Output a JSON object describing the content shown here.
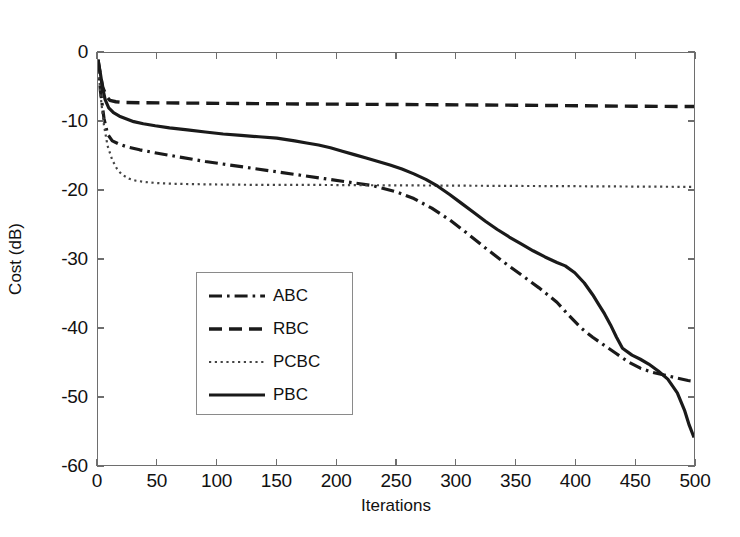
{
  "chart_data": {
    "type": "line",
    "title": "",
    "xlabel": "Iterations",
    "ylabel": "Cost (dB)",
    "xlim": [
      0,
      500
    ],
    "ylim": [
      -60,
      0
    ],
    "xticks": [
      0,
      50,
      100,
      150,
      200,
      250,
      300,
      350,
      400,
      450,
      500
    ],
    "yticks": [
      0,
      -10,
      -20,
      -30,
      -40,
      -50,
      -60
    ],
    "xticklabels": [
      "0",
      "50",
      "100",
      "150",
      "200",
      "250",
      "300",
      "350",
      "400",
      "450",
      "500"
    ],
    "yticklabels": [
      "0",
      "-10",
      "-20",
      "-30",
      "-40",
      "-50",
      "-60"
    ],
    "grid": false,
    "legend_position": "center-left",
    "series": [
      {
        "name": "ABC",
        "style": "dashdot",
        "color": "#1a1a1a",
        "x": [
          0,
          2,
          5,
          8,
          12,
          18,
          25,
          35,
          50,
          70,
          90,
          110,
          130,
          150,
          170,
          190,
          210,
          230,
          250,
          265,
          280,
          295,
          310,
          325,
          340,
          355,
          370,
          385,
          395,
          405,
          415,
          425,
          435,
          445,
          455,
          465,
          475,
          485,
          495,
          500
        ],
        "y": [
          -1.0,
          -5.5,
          -9.5,
          -11.8,
          -12.8,
          -13.3,
          -13.7,
          -14.1,
          -14.6,
          -15.2,
          -15.8,
          -16.3,
          -16.8,
          -17.3,
          -17.8,
          -18.3,
          -18.8,
          -19.3,
          -20.2,
          -21.2,
          -22.6,
          -24.3,
          -26.3,
          -28.4,
          -30.4,
          -32.3,
          -34.2,
          -36.3,
          -38.2,
          -40.0,
          -41.4,
          -42.6,
          -43.8,
          -45.0,
          -45.9,
          -46.5,
          -46.9,
          -47.3,
          -47.7,
          -47.8
        ]
      },
      {
        "name": "RBC",
        "style": "dashed",
        "color": "#1a1a1a",
        "x": [
          0,
          2,
          4,
          7,
          10,
          15,
          20,
          40,
          80,
          150,
          250,
          350,
          450,
          500
        ],
        "y": [
          -1.0,
          -3.2,
          -5.0,
          -6.3,
          -6.9,
          -7.1,
          -7.2,
          -7.25,
          -7.3,
          -7.4,
          -7.5,
          -7.6,
          -7.75,
          -7.8
        ]
      },
      {
        "name": "PCBC",
        "style": "dotted",
        "color": "#444444",
        "x": [
          0,
          2,
          5,
          8,
          12,
          16,
          20,
          26,
          32,
          40,
          50,
          65,
          80,
          100,
          130,
          170,
          220,
          280,
          340,
          400,
          450,
          500
        ],
        "y": [
          -1.0,
          -6.0,
          -10.5,
          -13.5,
          -15.6,
          -16.9,
          -17.7,
          -18.3,
          -18.6,
          -18.8,
          -18.95,
          -19.05,
          -19.1,
          -19.15,
          -19.2,
          -19.2,
          -19.25,
          -19.3,
          -19.35,
          -19.4,
          -19.45,
          -19.5
        ]
      },
      {
        "name": "PBC",
        "style": "solid",
        "color": "#1a1a1a",
        "x": [
          0,
          2,
          4,
          6,
          9,
          13,
          18,
          24,
          30,
          38,
          48,
          60,
          75,
          90,
          105,
          120,
          135,
          150,
          165,
          175,
          185,
          195,
          205,
          215,
          225,
          235,
          245,
          255,
          265,
          275,
          285,
          295,
          305,
          315,
          325,
          335,
          345,
          355,
          365,
          375,
          385,
          392,
          400,
          408,
          415,
          420,
          425,
          430,
          435,
          440,
          448,
          455,
          462,
          470,
          478,
          486,
          492,
          496,
          500
        ],
        "y": [
          -1.0,
          -3.0,
          -5.2,
          -6.8,
          -8.0,
          -8.7,
          -9.2,
          -9.6,
          -10.0,
          -10.3,
          -10.6,
          -10.9,
          -11.2,
          -11.5,
          -11.8,
          -12.0,
          -12.2,
          -12.4,
          -12.8,
          -13.1,
          -13.4,
          -13.8,
          -14.3,
          -14.8,
          -15.3,
          -15.8,
          -16.3,
          -16.9,
          -17.6,
          -18.4,
          -19.4,
          -20.6,
          -21.9,
          -23.2,
          -24.5,
          -25.7,
          -26.8,
          -27.8,
          -28.8,
          -29.7,
          -30.5,
          -31.0,
          -32.0,
          -33.5,
          -35.2,
          -36.6,
          -38.0,
          -39.6,
          -41.4,
          -43.0,
          -44.0,
          -44.6,
          -45.3,
          -46.3,
          -47.5,
          -49.5,
          -52.0,
          -54.2,
          -56.0
        ]
      }
    ]
  },
  "legend": {
    "items": [
      {
        "label": "ABC",
        "style": "dashdot"
      },
      {
        "label": "RBC",
        "style": "dashed"
      },
      {
        "label": "PCBC",
        "style": "dotted"
      },
      {
        "label": "PBC",
        "style": "solid"
      }
    ]
  }
}
